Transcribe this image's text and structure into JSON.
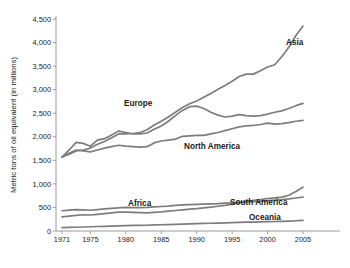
{
  "chart_data": {
    "type": "line",
    "title": "",
    "xlabel": "",
    "ylabel": "Metric tons of oil equivalent (in millions)",
    "xlim": [
      1971,
      2005
    ],
    "ylim": [
      0,
      4500
    ],
    "grid": false,
    "legend_position": "inline-labels",
    "xticks": [
      "1971",
      "1975",
      "1980",
      "1985",
      "1990",
      "1995",
      "2000",
      "2005"
    ],
    "xtick_values": [
      1971,
      1975,
      1980,
      1985,
      1990,
      1995,
      2000,
      2005
    ],
    "yticks": [
      "0",
      "500",
      "1,000",
      "1,500",
      "2,000",
      "2,500",
      "3,000",
      "3,500",
      "4,000",
      "4,500"
    ],
    "ytick_values": [
      0,
      500,
      1000,
      1500,
      2000,
      2500,
      3000,
      3500,
      4000,
      4500
    ],
    "line_color": "#7d7d7d",
    "x": [
      1971,
      1972,
      1973,
      1974,
      1975,
      1976,
      1977,
      1978,
      1979,
      1980,
      1981,
      1982,
      1983,
      1984,
      1985,
      1986,
      1987,
      1988,
      1989,
      1990,
      1991,
      1992,
      1993,
      1994,
      1995,
      1996,
      1997,
      1998,
      1999,
      2000,
      2001,
      2002,
      2003,
      2004,
      2005
    ],
    "series": [
      {
        "name": "Asia",
        "label": "Asia",
        "values": [
          1570,
          1630,
          1700,
          1720,
          1760,
          1840,
          1900,
          1980,
          2060,
          2060,
          2070,
          2090,
          2150,
          2250,
          2330,
          2420,
          2520,
          2620,
          2700,
          2760,
          2840,
          2920,
          3010,
          3090,
          3180,
          3280,
          3330,
          3330,
          3400,
          3480,
          3530,
          3700,
          3900,
          4150,
          4350
        ]
      },
      {
        "name": "Europe",
        "label": "Europe",
        "values": [
          1570,
          1720,
          1880,
          1860,
          1800,
          1930,
          1960,
          2040,
          2120,
          2090,
          2060,
          2060,
          2080,
          2160,
          2230,
          2330,
          2450,
          2560,
          2640,
          2650,
          2600,
          2520,
          2460,
          2420,
          2440,
          2470,
          2450,
          2440,
          2450,
          2480,
          2520,
          2550,
          2600,
          2660,
          2710
        ]
      },
      {
        "name": "North America",
        "label": "North America",
        "values": [
          1570,
          1650,
          1720,
          1700,
          1680,
          1720,
          1760,
          1790,
          1820,
          1800,
          1790,
          1780,
          1790,
          1870,
          1910,
          1930,
          1950,
          2010,
          2020,
          2030,
          2030,
          2060,
          2090,
          2130,
          2170,
          2210,
          2230,
          2240,
          2260,
          2290,
          2270,
          2280,
          2300,
          2330,
          2350
        ]
      },
      {
        "name": "South America",
        "label": "South America",
        "values": [
          300,
          315,
          330,
          345,
          340,
          355,
          370,
          385,
          400,
          400,
          395,
          390,
          385,
          395,
          405,
          420,
          435,
          450,
          465,
          475,
          490,
          505,
          525,
          545,
          570,
          600,
          630,
          650,
          665,
          690,
          705,
          720,
          760,
          840,
          930
        ]
      },
      {
        "name": "Africa",
        "label": "Africa",
        "values": [
          430,
          445,
          455,
          450,
          440,
          455,
          470,
          480,
          490,
          500,
          495,
          495,
          500,
          510,
          520,
          530,
          545,
          555,
          560,
          565,
          570,
          575,
          580,
          590,
          600,
          610,
          620,
          625,
          630,
          645,
          655,
          665,
          680,
          700,
          720
        ]
      },
      {
        "name": "Oceania",
        "label": "Oceania",
        "values": [
          70,
          75,
          80,
          85,
          90,
          95,
          100,
          105,
          110,
          115,
          118,
          120,
          122,
          128,
          133,
          137,
          142,
          147,
          152,
          157,
          160,
          164,
          168,
          172,
          177,
          182,
          187,
          190,
          194,
          199,
          202,
          205,
          210,
          218,
          225
        ]
      }
    ],
    "series_labels": [
      {
        "name": "Asia",
        "text": "Asia",
        "x": 286,
        "y": 45
      },
      {
        "name": "Europe",
        "text": "Europe",
        "x": 124,
        "y": 106
      },
      {
        "name": "North America",
        "text": "North America",
        "x": 184,
        "y": 149
      },
      {
        "name": "Africa",
        "text": "Africa",
        "x": 128,
        "y": 206
      },
      {
        "name": "South America",
        "text": "South America",
        "x": 230,
        "y": 205
      },
      {
        "name": "Oceania",
        "text": "Oceania",
        "x": 249,
        "y": 220
      }
    ]
  }
}
